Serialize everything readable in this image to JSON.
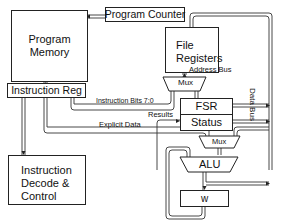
{
  "diagram": {
    "type": "architecture block diagram",
    "blocks": {
      "program_memory": "Program\nMemory",
      "program_memory_line1": "Program",
      "program_memory_line2": "Memory",
      "program_counter": "Program Counter",
      "file_registers_line1": "File",
      "file_registers_line2": "Registers",
      "instruction_reg": "Instruction Reg",
      "mux_top": "Mux",
      "fsr": "FSR",
      "status": "Status",
      "mux_bottom": "Mux",
      "alu": "ALU",
      "w": "w",
      "decode_line1": "Instruction",
      "decode_line2": "Decode &",
      "decode_line3": "Control"
    },
    "signals": {
      "address_bus": "Address Bus",
      "instruction_bits": "Instruction Bits 7:0",
      "results": "Results",
      "explicit_data": "Explicit Data",
      "data_bus": "Data Bus"
    },
    "colors": {
      "line": "#222222",
      "bus_fill": "#ffffff",
      "background": "#ffffff"
    }
  }
}
